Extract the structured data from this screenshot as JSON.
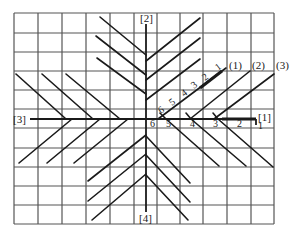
{
  "diagram": {
    "grid": {
      "x0": 14,
      "y0": 13,
      "x1": 274,
      "y1": 224,
      "cols": 11,
      "rows": 11,
      "color": "#555555"
    },
    "axes": {
      "top_label": "[2]",
      "bottom_label": "[4]",
      "left_label": "[3]",
      "right_label": "[1]"
    },
    "series_labels": [
      "(1)",
      "(2)",
      "(3)"
    ],
    "diagonal_numbers": [
      "1",
      "2",
      "3",
      "4",
      "5",
      "6"
    ],
    "axis_numbers": [
      "6",
      "5",
      "4",
      "3",
      "2",
      "1"
    ],
    "line_color": "#1a1a1a"
  }
}
